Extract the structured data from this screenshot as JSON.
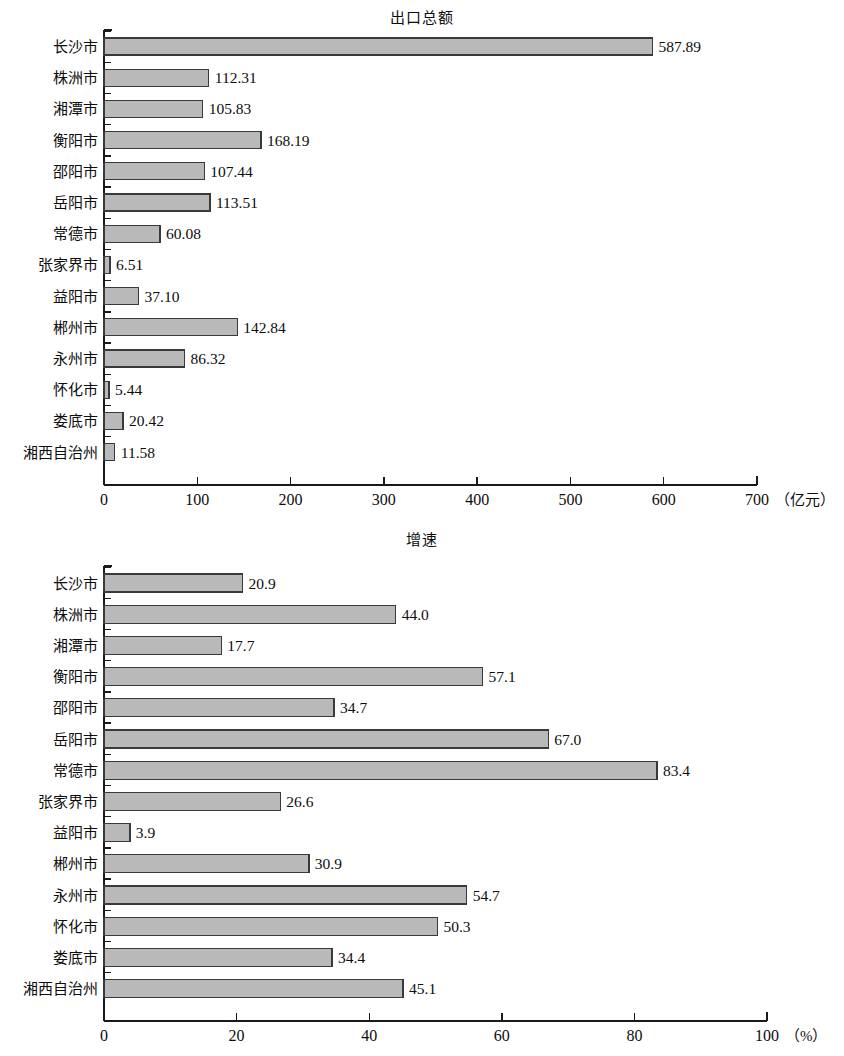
{
  "page": {
    "width": 844,
    "height": 1056,
    "background": "#ffffff",
    "bar_fill": "#b9b9b9",
    "bar_stroke": "#3a3a3a",
    "axis_color": "#1a1a1a"
  },
  "charts": [
    {
      "id": "chart-export",
      "title": "出口总额",
      "unit_label": "（亿元）",
      "axis_unit": "亿元"
    },
    {
      "id": "chart-growth",
      "title": "增速",
      "unit_label": "（%）",
      "axis_unit": "%"
    }
  ],
  "chart_data": [
    {
      "type": "bar",
      "orientation": "horizontal",
      "title": "出口总额",
      "xlabel": "（亿元）",
      "ylabel": "",
      "xlim": [
        0,
        700
      ],
      "xticks": [
        0,
        100,
        200,
        300,
        400,
        500,
        600,
        700
      ],
      "xtick_labels": [
        "0",
        "100",
        "200",
        "300",
        "400",
        "500",
        "600",
        "700"
      ],
      "grid": false,
      "legend": false,
      "value_label_format": "2dp",
      "categories": [
        "长沙市",
        "株洲市",
        "湘潭市",
        "衡阳市",
        "邵阳市",
        "岳阳市",
        "常德市",
        "张家界市",
        "益阳市",
        "郴州市",
        "永州市",
        "怀化市",
        "娄底市",
        "湘西自治州"
      ],
      "values": [
        587.89,
        112.31,
        105.83,
        168.19,
        107.44,
        113.51,
        60.08,
        6.51,
        37.1,
        142.84,
        86.32,
        5.44,
        20.42,
        11.58
      ],
      "value_labels": [
        "587.89",
        "112.31",
        "105.83",
        "168.19",
        "107.44",
        "113.51",
        "60.08",
        "6.51",
        "37.10",
        "142.84",
        "86.32",
        "5.44",
        "20.42",
        "11.58"
      ]
    },
    {
      "type": "bar",
      "orientation": "horizontal",
      "title": "增速",
      "xlabel": "（%）",
      "ylabel": "",
      "xlim": [
        0,
        100
      ],
      "xticks": [
        0,
        20,
        40,
        60,
        80,
        100
      ],
      "xtick_labels": [
        "0",
        "20",
        "40",
        "60",
        "80",
        "100"
      ],
      "grid": false,
      "legend": false,
      "value_label_format": "1dp",
      "categories": [
        "长沙市",
        "株洲市",
        "湘潭市",
        "衡阳市",
        "邵阳市",
        "岳阳市",
        "常德市",
        "张家界市",
        "益阳市",
        "郴州市",
        "永州市",
        "怀化市",
        "娄底市",
        "湘西自治州"
      ],
      "values": [
        20.9,
        44.0,
        17.7,
        57.1,
        34.7,
        67.0,
        83.4,
        26.6,
        3.9,
        30.9,
        54.7,
        50.3,
        34.4,
        45.1
      ],
      "value_labels": [
        "20.9",
        "44.0",
        "17.7",
        "57.1",
        "34.7",
        "67.0",
        "83.4",
        "26.6",
        "3.9",
        "30.9",
        "54.7",
        "50.3",
        "34.4",
        "45.1"
      ]
    }
  ]
}
